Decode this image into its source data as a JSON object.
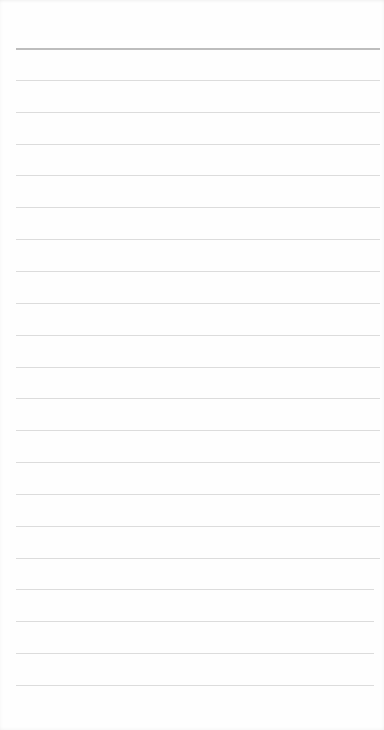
{
  "page": {
    "type": "lined-notepad",
    "background_color": "#fefefe",
    "header_rule_color": "#bdbdbd",
    "line_color": "#dcdcdc",
    "first_line_y": 48,
    "line_spacing": 31.85,
    "line_count": 21,
    "line_left": 16,
    "line_right": 380,
    "content": ""
  }
}
